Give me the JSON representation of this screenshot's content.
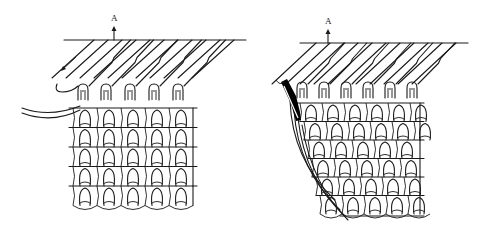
{
  "figure": {
    "colors": {
      "ink": "#1a1a1a",
      "background": "#ffffff",
      "selvage_element": "#000000"
    },
    "panels": [
      {
        "id": "left",
        "label": "A",
        "needle_count": 5,
        "fabric_courses": 5,
        "has_yarn_feed": true,
        "has_direction_arrow": true
      },
      {
        "id": "right",
        "label": "A",
        "needle_count": 6,
        "fabric_courses": 6,
        "has_selvage_hook": true,
        "has_tapered_edge": true
      }
    ]
  }
}
